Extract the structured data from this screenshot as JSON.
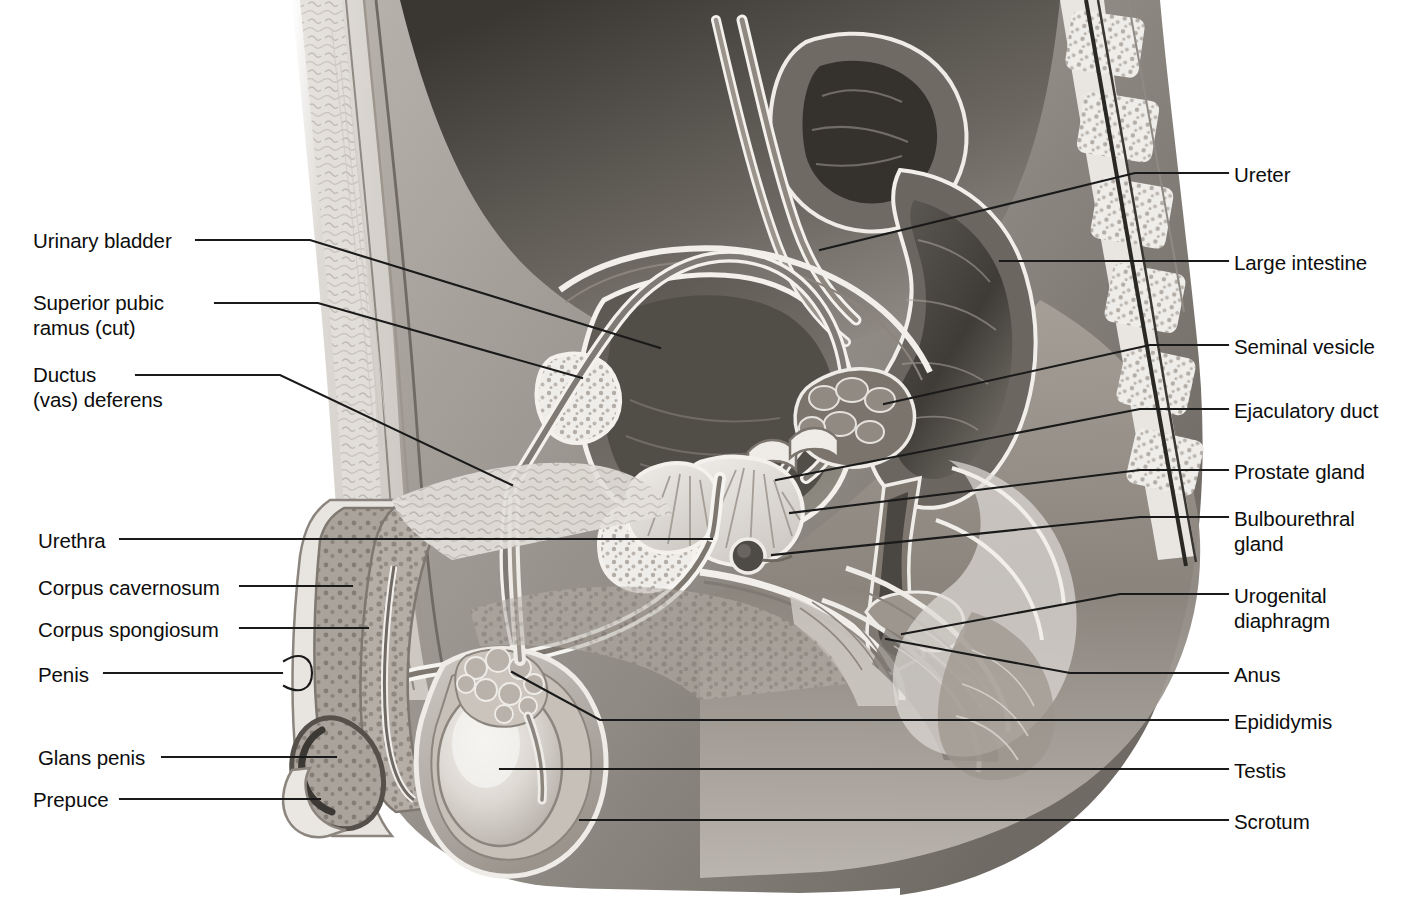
{
  "figure": {
    "style": "grayscale medical illustration",
    "colors": {
      "background": "#ffffff",
      "ink": "#111111",
      "leader": "#1a1a1a",
      "tissue_light": "#e6e3df",
      "tissue_mid": "#b9b4ae",
      "tissue_dark": "#8a8580",
      "cavity_dark": "#4a4742",
      "highlight": "#f7f5f2"
    }
  },
  "labels": {
    "left": [
      {
        "id": "urinary-bladder",
        "text": "Urinary bladder",
        "x": 33,
        "y": 228
      },
      {
        "id": "superior-pubic-ramus",
        "text": "Superior pubic\nramus (cut)",
        "x": 33,
        "y": 290
      },
      {
        "id": "ductus-vas-deferens",
        "text": "Ductus\n(vas) deferens",
        "x": 33,
        "y": 362
      },
      {
        "id": "urethra",
        "text": "Urethra",
        "x": 38,
        "y": 528
      },
      {
        "id": "corpus-cavernosum",
        "text": "Corpus cavernosum",
        "x": 38,
        "y": 575
      },
      {
        "id": "corpus-spongiosum",
        "text": "Corpus spongiosum",
        "x": 38,
        "y": 617
      },
      {
        "id": "penis",
        "text": "Penis",
        "x": 38,
        "y": 662
      },
      {
        "id": "glans-penis",
        "text": "Glans penis",
        "x": 38,
        "y": 745
      },
      {
        "id": "prepuce",
        "text": "Prepuce",
        "x": 33,
        "y": 787
      }
    ],
    "right": [
      {
        "id": "ureter",
        "text": "Ureter",
        "x": 1234,
        "y": 162
      },
      {
        "id": "large-intestine",
        "text": "Large intestine",
        "x": 1234,
        "y": 250
      },
      {
        "id": "seminal-vesicle",
        "text": "Seminal vesicle",
        "x": 1234,
        "y": 334
      },
      {
        "id": "ejaculatory-duct",
        "text": "Ejaculatory duct",
        "x": 1234,
        "y": 398
      },
      {
        "id": "prostate-gland",
        "text": "Prostate gland",
        "x": 1234,
        "y": 459
      },
      {
        "id": "bulbourethral-gland",
        "text": "Bulbourethral\ngland",
        "x": 1234,
        "y": 506
      },
      {
        "id": "urogenital-diaphragm",
        "text": "Urogenital\ndiaphragm",
        "x": 1234,
        "y": 583
      },
      {
        "id": "anus",
        "text": "Anus",
        "x": 1234,
        "y": 662
      },
      {
        "id": "epididymis",
        "text": "Epididymis",
        "x": 1234,
        "y": 709
      },
      {
        "id": "testis",
        "text": "Testis",
        "x": 1234,
        "y": 758
      },
      {
        "id": "scrotum",
        "text": "Scrotum",
        "x": 1234,
        "y": 809
      }
    ]
  },
  "leaders": {
    "left": [
      {
        "id": "leader-urinary-bladder",
        "d": "M 196 240 L 310 240 L 660 348"
      },
      {
        "id": "leader-superior-pubic-ramus",
        "d": "M 215 303 L 318 303 L 582 378"
      },
      {
        "id": "leader-ductus-vas-deferens",
        "d": "M 136 375 L 280 375 L 512 485"
      },
      {
        "id": "leader-urethra",
        "d": "M 120 539 L 712 539"
      },
      {
        "id": "leader-corpus-cavernosum",
        "d": "M 240 586 L 352 586"
      },
      {
        "id": "leader-corpus-spongiosum",
        "d": "M 240 628 L 368 628"
      },
      {
        "id": "leader-penis",
        "d": "M 104 673 L 282 673"
      },
      {
        "id": "leader-glans-penis",
        "d": "M 162 757 L 336 757"
      },
      {
        "id": "leader-prepuce",
        "d": "M 120 799 L 320 799"
      }
    ],
    "left_brace": {
      "id": "leader-penis-brace",
      "d": "M 284 661 C 300 651 312 657 312 673 C 312 689 300 695 284 686"
    },
    "right": [
      {
        "id": "leader-ureter",
        "d": "M 1228 173 L 1135 173 L 820 250"
      },
      {
        "id": "leader-large-intestine",
        "d": "M 1228 261 L 1000 261"
      },
      {
        "id": "leader-seminal-vesicle",
        "d": "M 1228 345 L 1150 345 L 884 404"
      },
      {
        "id": "leader-ejaculatory-duct",
        "d": "M 1228 409 L 1140 409 L 776 480"
      },
      {
        "id": "leader-prostate-gland",
        "d": "M 1228 470 L 1140 470 L 790 513"
      },
      {
        "id": "leader-bulbourethral-gland",
        "d": "M 1228 517 L 1140 517 L 772 555"
      },
      {
        "id": "leader-urogenital-diaphragm",
        "d": "M 1228 594 L 1120 594 L 902 634"
      },
      {
        "id": "leader-anus",
        "d": "M 1228 673 L 1070 673 L 886 639"
      },
      {
        "id": "leader-epididymis",
        "d": "M 1228 720 L 600 720 L 512 672"
      },
      {
        "id": "leader-testis",
        "d": "M 1228 769 L 500 769"
      },
      {
        "id": "leader-scrotum",
        "d": "M 1228 820 L 580 820"
      }
    ]
  }
}
